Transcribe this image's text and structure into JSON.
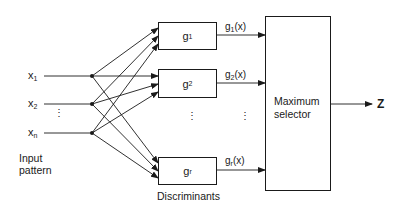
{
  "inputs": [
    {
      "base": "x",
      "sub": "1"
    },
    {
      "base": "x",
      "sub": "2"
    },
    {
      "base": "x",
      "sub": "n"
    }
  ],
  "input_label": {
    "line1": "Input",
    "line2": "pattern"
  },
  "discriminants": [
    {
      "base": "g",
      "sub": "1",
      "output_base": "g",
      "output_sub": "1",
      "output_arg": "(x)"
    },
    {
      "base": "g",
      "sub": "2",
      "output_base": "g",
      "output_sub": "2",
      "output_arg": "(x)"
    },
    {
      "base": "g",
      "sub": "r",
      "output_base": "g",
      "output_sub": "r",
      "output_arg": "(x)"
    }
  ],
  "discriminants_label": "Discriminants",
  "selector": {
    "line1": "Maximum",
    "line2": "selector"
  },
  "output_label": "Z",
  "ellipsis": "⋮"
}
